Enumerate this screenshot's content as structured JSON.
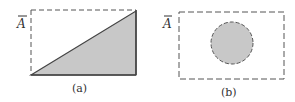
{
  "figure_a": {
    "set_label": "A",
    "caption": "(a)",
    "region": {
      "x": 31,
      "y": 10,
      "width": 105,
      "height": 65
    },
    "shaded": "lower-right triangle"
  },
  "figure_b": {
    "set_label": "A",
    "caption": "(b)",
    "region": {
      "x": 179,
      "y": 12,
      "width": 105,
      "height": 67
    },
    "circle": {
      "cx": 232,
      "cy": 43,
      "r": 21
    }
  },
  "colors": {
    "stroke": "#444444",
    "fill": "#c8c8c8",
    "background": "#ffffff"
  }
}
